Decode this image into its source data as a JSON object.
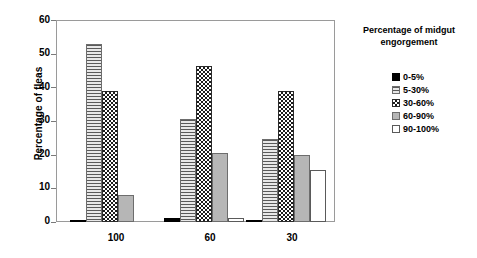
{
  "chart_data": {
    "type": "bar",
    "title": "",
    "xlabel": "",
    "ylabel": "Percentage of fleas",
    "categories": [
      "100",
      "60",
      "30"
    ],
    "ylim": [
      0,
      60
    ],
    "yticks": [
      0,
      10,
      20,
      30,
      40,
      50,
      60
    ],
    "ytick_labels": [
      "0",
      "10",
      "20",
      "30",
      "40",
      "50",
      "60"
    ],
    "grid": false,
    "legend_position": "right",
    "legend_title": "Percentage of midgut engorgement",
    "series": [
      {
        "name": "0-5%",
        "pattern": "solid-black",
        "values": [
          0.5,
          1.2,
          0.4
        ]
      },
      {
        "name": "5-30%",
        "pattern": "horizontal-lines",
        "values": [
          52.8,
          30.6,
          24.8
        ]
      },
      {
        "name": "30-60%",
        "pattern": "checkerboard",
        "values": [
          38.9,
          46.4,
          39.0
        ]
      },
      {
        "name": "60-90%",
        "pattern": "solid-gray",
        "values": [
          8.0,
          20.6,
          19.8
        ]
      },
      {
        "name": "90-100%",
        "pattern": "white",
        "values": [
          0.0,
          1.1,
          15.5
        ]
      }
    ]
  },
  "axis": {
    "y_title": "Percentage of fleas",
    "y_tick_labels": [
      "60",
      "50",
      "40",
      "30",
      "20",
      "10",
      "0"
    ],
    "x_tick_labels": [
      "100",
      "60",
      "30"
    ]
  },
  "legend": {
    "title_line_1": "Percentage of midgut",
    "title_line_2": "engorgement",
    "items": [
      {
        "label": "0-5%"
      },
      {
        "label": "5-30%"
      },
      {
        "label": "30-60%"
      },
      {
        "label": "60-90%"
      },
      {
        "label": "90-100%"
      }
    ]
  },
  "colors": {
    "axis": "#9a9a9a",
    "text": "#000000",
    "bar_black": "#000000",
    "bar_gray": "#b6b6b6",
    "bar_white": "#ffffff"
  }
}
